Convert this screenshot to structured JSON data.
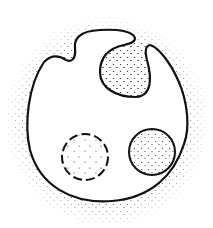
{
  "diagram": {
    "type": "cell-membrane-vesicle-illustration",
    "labels": [],
    "colors": {
      "background": "#ffffff",
      "outline": "#111111",
      "stipple": "#333333"
    },
    "elements": [
      {
        "id": "cell-membrane",
        "shape": "closed-curve",
        "style": "solid"
      },
      {
        "id": "invaginating-vesicle",
        "shape": "circle-pocket",
        "position": "top-right",
        "style": "solid",
        "filled": "stipple"
      },
      {
        "id": "internal-vesicle",
        "shape": "circle",
        "position": "lower-left",
        "style": "dashed",
        "filled": "sparse-stipple"
      },
      {
        "id": "fusing-vesicle",
        "shape": "circle",
        "position": "lower-right",
        "style": "solid",
        "filled": "stipple"
      },
      {
        "id": "extracellular-medium",
        "shape": "stipple-halo",
        "position": "surrounding"
      }
    ]
  }
}
